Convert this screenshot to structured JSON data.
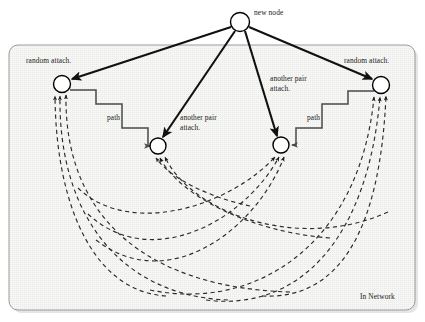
{
  "diagram": {
    "canvas": {
      "width": 425,
      "height": 322,
      "background": "#ffffff"
    },
    "frame": {
      "label": "In Network",
      "label_x": 362,
      "label_y": 297,
      "x": 9,
      "y": 45,
      "width": 406,
      "height": 265,
      "corner_radius": 9,
      "fill": "#f4f4f2",
      "stroke": "#8c8c8c",
      "shadow": "#c9c9c9"
    },
    "colors": {
      "node_fill": "#ffffff",
      "node_stroke": "#000000",
      "solid_edge": "#111111",
      "dashed_edge": "#333333",
      "path_edge": "#4a4a4a",
      "text": "#1a1a1a"
    },
    "nodes": [
      {
        "id": "new",
        "label": "new node",
        "x": 240,
        "y": 22,
        "r": 9.5,
        "label_x": 254,
        "label_y": 13
      },
      {
        "id": "left",
        "label": "random attach.",
        "x": 62,
        "y": 84,
        "r": 8.5,
        "label_x": 27,
        "label_y": 56
      },
      {
        "id": "mid1",
        "label": "another pair attach.",
        "x": 158,
        "y": 146,
        "r": 8,
        "label_x": 180,
        "label_y": 113
      },
      {
        "id": "mid2",
        "label": "another pair attach.",
        "x": 281,
        "y": 145,
        "r": 8,
        "label_x": 271,
        "label_y": 75
      },
      {
        "id": "right",
        "label": "random attach.",
        "x": 381,
        "y": 85,
        "r": 8.5,
        "label_x": 345,
        "label_y": 56
      }
    ],
    "attach_edges": [
      {
        "from": "new",
        "to": "left",
        "kind": "solid-arrow"
      },
      {
        "from": "new",
        "to": "mid1",
        "kind": "solid-arrow"
      },
      {
        "from": "new",
        "to": "mid2",
        "kind": "solid-arrow"
      },
      {
        "from": "new",
        "to": "right",
        "kind": "solid-arrow"
      }
    ],
    "path_edges": [
      {
        "label": "path",
        "label_x": 108,
        "label_y": 114,
        "from": "left",
        "to": "mid1",
        "kind": "staircase-arrow"
      },
      {
        "label": "path",
        "label_x": 308,
        "label_y": 114,
        "from": "right",
        "to": "mid2",
        "kind": "staircase-arrow"
      }
    ],
    "dashed_arcs": {
      "description": "dashed directed arcs curving below, terminating with arrowheads at the four in-network nodes",
      "count": 12,
      "targets": [
        "left",
        "left",
        "left",
        "mid1",
        "mid1",
        "mid1",
        "mid2",
        "mid2",
        "mid2",
        "right",
        "right",
        "right"
      ]
    },
    "labels": {
      "new_node": "new node",
      "random_attach_left": "random attach.",
      "random_attach_right": "random attach.",
      "another_pair_attach_left": "another pair\nattach.",
      "another_pair_attach_right": "another pair\nattach.",
      "path_left": "path",
      "path_right": "path",
      "in_network": "In Network"
    }
  }
}
